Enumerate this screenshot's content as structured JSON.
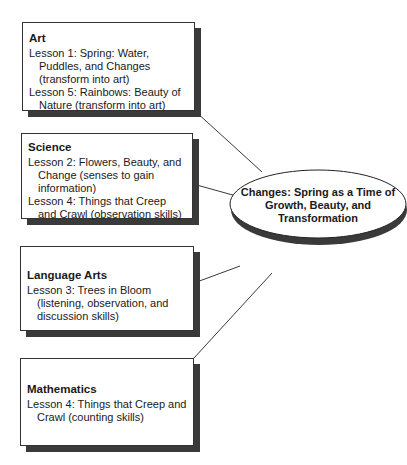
{
  "center": {
    "line1": "Changes: Spring as a Time of",
    "line2": "Growth, Beauty, and",
    "line3": "Transformation"
  },
  "boxes": [
    {
      "title": "Art",
      "lessons": [
        "Lesson 1: Spring: Water, Puddles, and Changes (transform into art)",
        "Lesson 5: Rainbows: Beauty of Nature (transform into art)"
      ]
    },
    {
      "title": "Science",
      "lessons": [
        "Lesson 2: Flowers, Beauty, and Change (senses to gain information)",
        "Lesson 4: Things that Creep and Crawl (observation skills)"
      ]
    },
    {
      "title": "Language Arts",
      "lessons": [
        "Lesson 3: Trees in Bloom (listening, observation, and discussion skills)"
      ]
    },
    {
      "title": "Mathematics",
      "lessons": [
        "Lesson 4: Things that Creep and Crawl (counting skills)"
      ]
    }
  ],
  "colors": {
    "shadow": "#3a3a3a",
    "border": "#333333"
  }
}
